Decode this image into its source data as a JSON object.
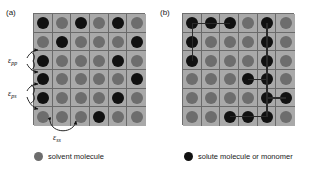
{
  "figure": {
    "panels": [
      {
        "id": "a",
        "label": "(a)",
        "caption": "",
        "grid": {
          "rows": 6,
          "cols": 6,
          "cells": [
            [
              "solute",
              "solvent",
              "solute",
              "solvent",
              "solute",
              "solvent"
            ],
            [
              "solvent",
              "solute",
              "solvent",
              "solvent",
              "solvent",
              "solute"
            ],
            [
              "solute",
              "solvent",
              "solvent",
              "solvent",
              "solute",
              "solvent"
            ],
            [
              "solute",
              "solvent",
              "solvent",
              "solvent",
              "solvent",
              "solute"
            ],
            [
              "solute",
              "solvent",
              "solvent",
              "solvent",
              "solute",
              "solvent"
            ],
            [
              "solvent",
              "solvent",
              "solvent",
              "solute",
              "solvent",
              "solvent"
            ]
          ],
          "bonds": []
        },
        "annotations": [
          {
            "name": "epsilon-pp",
            "symbol": "ε",
            "subscript": "pp"
          },
          {
            "name": "epsilon-ps",
            "symbol": "ε",
            "subscript": "ps"
          },
          {
            "name": "epsilon-ss",
            "symbol": "ε",
            "subscript": "ss"
          }
        ]
      },
      {
        "id": "b",
        "label": "(b)",
        "caption": "",
        "grid": {
          "rows": 6,
          "cols": 6,
          "cells": [
            [
              "solute",
              "solute",
              "solute",
              "solvent",
              "solute",
              "solvent"
            ],
            [
              "solute",
              "solvent",
              "solvent",
              "solvent",
              "solute",
              "solvent"
            ],
            [
              "solute",
              "solvent",
              "solvent",
              "solvent",
              "solute",
              "solvent"
            ],
            [
              "solvent",
              "solvent",
              "solvent",
              "solute",
              "solute",
              "solvent"
            ],
            [
              "solvent",
              "solvent",
              "solvent",
              "solvent",
              "solute",
              "solute"
            ],
            [
              "solvent",
              "solvent",
              "solute",
              "solute",
              "solute",
              "solvent"
            ]
          ],
          "bonds": [
            {
              "r1": 0,
              "c1": 0,
              "r2": 0,
              "c2": 1
            },
            {
              "r1": 0,
              "c1": 1,
              "r2": 0,
              "c2": 2
            },
            {
              "r1": 0,
              "c1": 0,
              "r2": 1,
              "c2": 0
            },
            {
              "r1": 1,
              "c1": 0,
              "r2": 2,
              "c2": 0
            },
            {
              "r1": 0,
              "c1": 4,
              "r2": 1,
              "c2": 4
            },
            {
              "r1": 1,
              "c1": 4,
              "r2": 2,
              "c2": 4
            },
            {
              "r1": 2,
              "c1": 4,
              "r2": 3,
              "c2": 4
            },
            {
              "r1": 3,
              "c1": 3,
              "r2": 3,
              "c2": 4
            },
            {
              "r1": 3,
              "c1": 4,
              "r2": 4,
              "c2": 4
            },
            {
              "r1": 4,
              "c1": 4,
              "r2": 4,
              "c2": 5
            },
            {
              "r1": 4,
              "c1": 4,
              "r2": 5,
              "c2": 4
            },
            {
              "r1": 5,
              "c1": 3,
              "r2": 5,
              "c2": 4
            },
            {
              "r1": 5,
              "c1": 2,
              "r2": 5,
              "c2": 3
            }
          ]
        },
        "annotations": []
      }
    ],
    "legend": [
      {
        "name": "legend-solvent",
        "marker": "solvent",
        "text": "solvent molecule"
      },
      {
        "name": "legend-solute",
        "marker": "solute",
        "text": "solute molecule or monomer"
      }
    ],
    "colors": {
      "solvent_fill": "#6d6d6d",
      "solute_fill": "#111111",
      "lattice_background": "#a8a8a8",
      "lattice_line": "#6a6a6a",
      "page_background": "#ffffff",
      "text": "#1a1a1a"
    }
  }
}
